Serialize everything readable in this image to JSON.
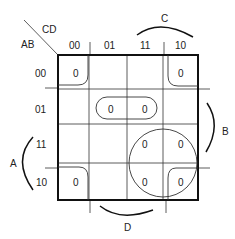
{
  "diagram": {
    "type": "karnaugh-map",
    "row_variable_label": "AB",
    "column_variable_label": "CD",
    "column_headers": [
      "00",
      "01",
      "11",
      "10"
    ],
    "row_headers": [
      "00",
      "01",
      "11",
      "10"
    ],
    "cells": [
      [
        "0",
        "",
        "",
        "0"
      ],
      [
        "",
        "0",
        "0",
        ""
      ],
      [
        "",
        "",
        "0",
        "0"
      ],
      [
        "0",
        "",
        "0",
        "0"
      ]
    ],
    "brace_labels": {
      "top": "C",
      "right": "B",
      "left": "A",
      "bottom": "D"
    },
    "groupings": [
      "four corners (AB=00/10, CD=00/10)",
      "row 01, columns 01-11",
      "rows 11-10, columns 11-10"
    ]
  }
}
